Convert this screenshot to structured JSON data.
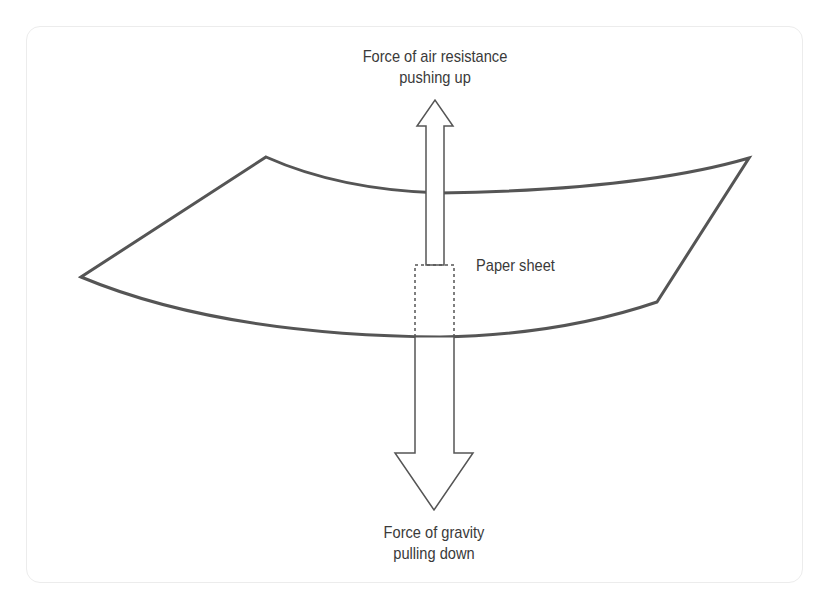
{
  "diagram": {
    "type": "force-diagram",
    "subject_label": "Paper sheet",
    "forces": [
      {
        "name": "air-resistance",
        "direction": "up",
        "label_line1": "Force of air resistance",
        "label_line2": "pushing up"
      },
      {
        "name": "gravity",
        "direction": "down",
        "label_line1": "Force of gravity",
        "label_line2": "pulling down"
      }
    ],
    "colors": {
      "outline": "#555555",
      "text": "#3a3a3a",
      "frame_border": "#ececec",
      "background": "#ffffff"
    }
  }
}
